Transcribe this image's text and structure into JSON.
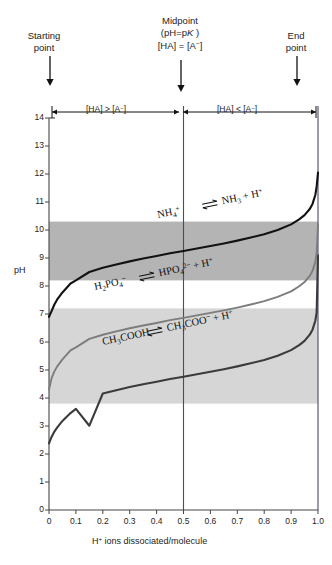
{
  "figure": {
    "annotations": {
      "starting_point": "Starting\npoint",
      "starting_point_l1": "Starting",
      "starting_point_l2": "point",
      "midpoint_l1": "Midpoint",
      "midpoint_l2_pre": "(pH=p",
      "midpoint_l2_k": "K",
      "midpoint_l2_post": " )",
      "midpoint_l3": "[HA] = [A−]",
      "end_point_l1": "End",
      "end_point_l2": "point",
      "bracket_left": "[HA] > [A−]",
      "bracket_right": "[HA] < [A−]"
    }
  },
  "chart_data": {
    "type": "line",
    "title": "",
    "xlabel": "H+ ions dissociated/molecule",
    "xlabel_parts": {
      "h": "H",
      "plus": "+",
      "rest": " ions dissociated/molecule"
    },
    "ylabel": "pH",
    "xlim": [
      0,
      1.0
    ],
    "ylim": [
      0,
      14
    ],
    "xticks": [
      "0",
      "0.1",
      "0.2",
      "0.3",
      "0.4",
      "0.5",
      "0.6",
      "0.7",
      "0.8",
      "0.9",
      "1.0"
    ],
    "xtick_values": [
      0,
      0.1,
      0.2,
      0.3,
      0.4,
      0.5,
      0.6,
      0.7,
      0.8,
      0.9,
      1.0
    ],
    "yticks": [
      "0",
      "1",
      "2",
      "3",
      "4",
      "5",
      "6",
      "7",
      "8",
      "9",
      "10",
      "11",
      "12",
      "13",
      "14"
    ],
    "ytick_values": [
      0,
      1,
      2,
      3,
      4,
      5,
      6,
      7,
      8,
      9,
      10,
      11,
      12,
      13,
      14
    ],
    "grid": false,
    "legend": "none",
    "midpoint_x": 0.5,
    "series": [
      {
        "name": "CH3COOH",
        "label_left": "CH3COOH",
        "label_right": "CH3COO− + H+",
        "pK": 4.76,
        "color": "#3b3b3b",
        "x": [
          0.0,
          0.01,
          0.02,
          0.03,
          0.05,
          0.08,
          0.1,
          0.15,
          0.2,
          0.25,
          0.3,
          0.35,
          0.4,
          0.45,
          0.5,
          0.55,
          0.6,
          0.65,
          0.7,
          0.75,
          0.8,
          0.85,
          0.9,
          0.93,
          0.95,
          0.97,
          0.98,
          0.99,
          0.995,
          1.0
        ],
        "y": [
          2.38,
          2.62,
          2.8,
          2.94,
          3.18,
          3.46,
          3.61,
          3.01,
          4.16,
          4.28,
          4.39,
          4.49,
          4.58,
          4.68,
          4.76,
          4.85,
          4.94,
          5.03,
          5.13,
          5.24,
          5.36,
          5.51,
          5.71,
          5.89,
          6.04,
          6.27,
          6.45,
          6.76,
          7.06,
          9.1
        ]
      },
      {
        "name": "H2PO4-",
        "label_left": "H2PO4−",
        "label_right": "HPO4 2− + H+",
        "pK": 6.86,
        "color": "#7d7d7d",
        "x": [
          0.0,
          0.01,
          0.02,
          0.03,
          0.05,
          0.08,
          0.1,
          0.15,
          0.2,
          0.25,
          0.3,
          0.35,
          0.4,
          0.45,
          0.5,
          0.55,
          0.6,
          0.65,
          0.7,
          0.75,
          0.8,
          0.85,
          0.9,
          0.93,
          0.95,
          0.97,
          0.98,
          0.99,
          0.995,
          1.0
        ],
        "y": [
          4.3,
          4.72,
          4.95,
          5.12,
          5.38,
          5.7,
          5.81,
          6.11,
          6.26,
          6.38,
          6.49,
          6.59,
          6.68,
          6.78,
          6.86,
          6.95,
          7.04,
          7.13,
          7.23,
          7.34,
          7.46,
          7.61,
          7.81,
          7.99,
          8.14,
          8.37,
          8.55,
          8.86,
          9.16,
          10.2
        ]
      },
      {
        "name": "NH4+",
        "label_left": "NH4+",
        "label_right": "NH3 + H+",
        "pK": 9.25,
        "color": "#121212",
        "x": [
          0.0,
          0.01,
          0.02,
          0.03,
          0.05,
          0.08,
          0.1,
          0.15,
          0.2,
          0.25,
          0.3,
          0.35,
          0.4,
          0.45,
          0.5,
          0.55,
          0.6,
          0.65,
          0.7,
          0.75,
          0.8,
          0.85,
          0.9,
          0.93,
          0.95,
          0.97,
          0.98,
          0.99,
          0.995,
          1.0
        ],
        "y": [
          6.9,
          7.11,
          7.34,
          7.51,
          7.77,
          8.09,
          8.2,
          8.5,
          8.65,
          8.77,
          8.88,
          8.98,
          9.07,
          9.17,
          9.25,
          9.34,
          9.43,
          9.52,
          9.62,
          9.73,
          9.85,
          10.0,
          10.2,
          10.38,
          10.53,
          10.76,
          10.94,
          11.25,
          11.55,
          12.05
        ]
      }
    ],
    "buffer_bands": [
      {
        "name": "phosphate-acetate-band",
        "ymin": 3.8,
        "ymax": 7.2,
        "color": "#d6d6d6"
      },
      {
        "name": "ammonium-band",
        "ymin": 8.2,
        "ymax": 10.3,
        "color": "#b4b4b4"
      }
    ]
  }
}
